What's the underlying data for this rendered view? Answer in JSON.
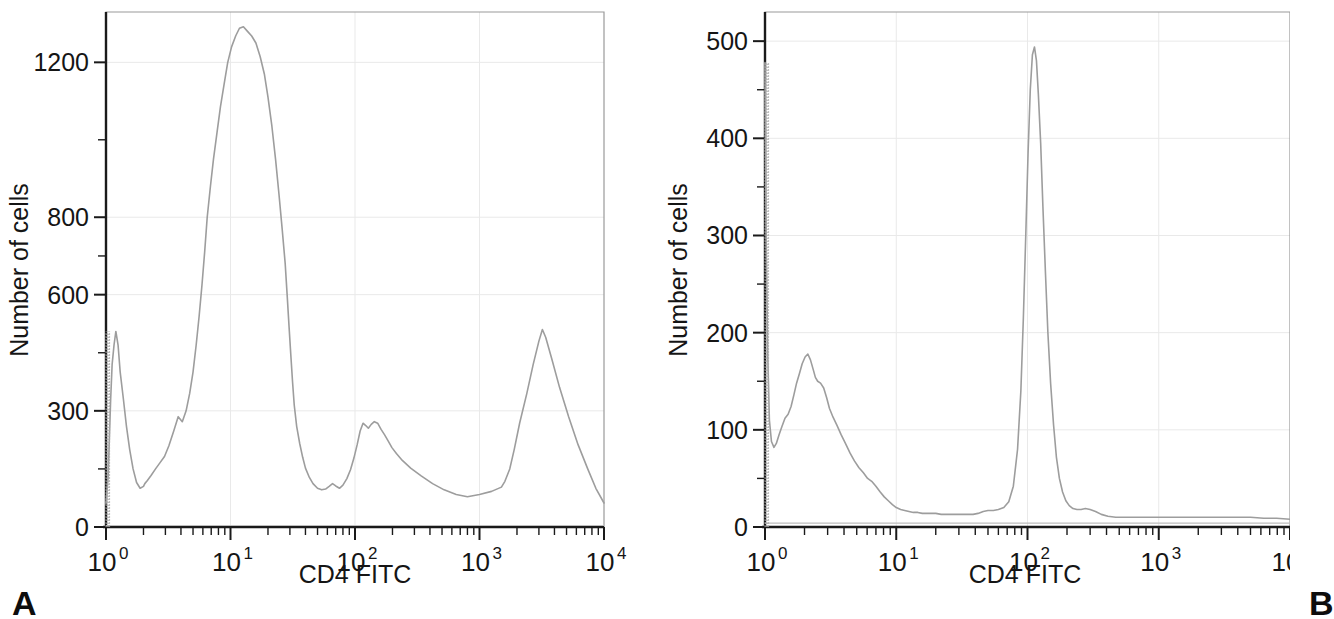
{
  "figure": {
    "background_color": "#ffffff",
    "trace_color": "#9d9d9d",
    "axis_color": "#1a1a1a",
    "grid_color": "#e9e9e9"
  },
  "panels": [
    {
      "letter": "A",
      "x_axis_title": "CD4 FITC",
      "y_axis_title": "Number of cells",
      "x_tick_bases": [
        "10",
        "10",
        "10",
        "10",
        "10"
      ],
      "x_tick_exponents": [
        "0",
        "1",
        "2",
        "3",
        "4"
      ],
      "y_tick_labels": [
        "1200",
        "800",
        "600",
        "300",
        "0"
      ]
    },
    {
      "letter": "B",
      "x_axis_title": "CD4 FITC",
      "y_axis_title": "Number of cells",
      "x_tick_bases": [
        "10",
        "10",
        "10",
        "10",
        "10"
      ],
      "x_tick_exponents": [
        "0",
        "1",
        "2",
        "3",
        "4"
      ],
      "y_tick_labels": [
        "500",
        "400",
        "300",
        "200",
        "100",
        "0"
      ]
    }
  ],
  "chart_data": [
    {
      "type": "line",
      "panel": "A",
      "title": "",
      "xlabel": "CD4 FITC",
      "ylabel": "Number of cells",
      "xscale": "log",
      "xlim": [
        1,
        10000
      ],
      "ylim": [
        0,
        1330
      ],
      "x_tick_values": [
        1,
        10,
        100,
        1000,
        10000
      ],
      "x_tick_labels": [
        "10^0",
        "10^1",
        "10^2",
        "10^3",
        "10^4"
      ],
      "y_tick_values": [
        0,
        300,
        600,
        800,
        1200
      ],
      "y_tick_labels": [
        "0",
        "300",
        "600",
        "800",
        "1200"
      ],
      "grid": true,
      "legend": "none",
      "series": [
        {
          "name": "CD4 FITC histogram (panel A)",
          "x": [
            1.0,
            1.02,
            1.04,
            1.06,
            1.09,
            1.12,
            1.16,
            1.2,
            1.25,
            1.3,
            1.38,
            1.46,
            1.55,
            1.65,
            1.76,
            1.88,
            2.0,
            2.05,
            2.15,
            2.3,
            2.5,
            2.7,
            2.95,
            3.2,
            3.5,
            3.8,
            4.1,
            4.4,
            4.7,
            5.0,
            5.3,
            5.6,
            5.9,
            6.2,
            6.5,
            6.9,
            7.3,
            7.8,
            8.3,
            8.9,
            9.5,
            10.2,
            11.0,
            11.8,
            12.7,
            13.7,
            14.8,
            16.0,
            17.3,
            18.7,
            20.0,
            21.5,
            23.0,
            24.5,
            26.0,
            27.5,
            28.5,
            29.5,
            30.5,
            31.5,
            32.5,
            34.0,
            36.0,
            38.0,
            40.0,
            43.0,
            46.0,
            50.0,
            54.0,
            58.0,
            62.0,
            66.0,
            70.0,
            75.0,
            80.0,
            86.0,
            92.0,
            98.0,
            104.0,
            110.0,
            116.0,
            122.0,
            128.0,
            135.0,
            143.0,
            152.0,
            162.0,
            173.0,
            185.0,
            198.0,
            215.0,
            240.0,
            280.0,
            340.0,
            420.0,
            520.0,
            650.0,
            800.0,
            1000.0,
            1250.0,
            1500.0,
            1600.0,
            1750.0,
            1900.0,
            2100.0,
            2400.0,
            2700.0,
            3000.0,
            3200.0,
            3400.0,
            3800.0,
            4400.0,
            5200.0,
            6200.0,
            7400.0,
            8600.0,
            10000.0
          ],
          "y": [
            60,
            95,
            130,
            210,
            330,
            420,
            470,
            505,
            470,
            400,
            330,
            260,
            200,
            150,
            115,
            100,
            105,
            112,
            120,
            133,
            150,
            165,
            182,
            210,
            248,
            285,
            272,
            300,
            345,
            400,
            470,
            545,
            625,
            710,
            800,
            880,
            950,
            1020,
            1085,
            1145,
            1200,
            1240,
            1268,
            1288,
            1292,
            1280,
            1268,
            1250,
            1215,
            1170,
            1110,
            1035,
            950,
            860,
            770,
            680,
            600,
            520,
            445,
            375,
            315,
            260,
            215,
            180,
            152,
            128,
            112,
            100,
            96,
            98,
            105,
            112,
            106,
            100,
            108,
            125,
            148,
            178,
            212,
            248,
            268,
            262,
            255,
            265,
            272,
            268,
            252,
            238,
            222,
            205,
            190,
            172,
            152,
            132,
            112,
            96,
            84,
            78,
            84,
            92,
            103,
            118,
            150,
            200,
            268,
            345,
            420,
            480,
            510,
            490,
            435,
            360,
            285,
            212,
            150,
            100,
            62
          ],
          "spike": {
            "x": 1.0,
            "y_top": 505,
            "description": "dense vertical spike at channel 1 from 0 to ~505"
          }
        }
      ],
      "features": {
        "peak_1_x": 1.0,
        "peak_1_y": 505,
        "peak_2_x": 5.6,
        "peak_2_y": 1290,
        "peak_3_x": 29.0,
        "peak_3_y": 272,
        "peak_4_x": 115.0,
        "peak_4_y": 500,
        "baseline_after_200": 12
      }
    },
    {
      "type": "line",
      "panel": "B",
      "title": "",
      "xlabel": "CD4 FITC",
      "ylabel": "Number of cells",
      "xscale": "log",
      "xlim": [
        1,
        10000
      ],
      "ylim": [
        0,
        530
      ],
      "x_tick_values": [
        1,
        10,
        100,
        1000,
        10000
      ],
      "x_tick_labels": [
        "10^0",
        "10^1",
        "10^2",
        "10^3",
        "10^4"
      ],
      "y_tick_values": [
        0,
        100,
        200,
        300,
        400,
        500
      ],
      "y_tick_labels": [
        "0",
        "100",
        "200",
        "300",
        "400",
        "500"
      ],
      "grid": true,
      "legend": "none",
      "series": [
        {
          "name": "CD4 FITC histogram (panel B)",
          "x": [
            1.0,
            1.02,
            1.05,
            1.08,
            1.12,
            1.17,
            1.22,
            1.28,
            1.35,
            1.42,
            1.5,
            1.58,
            1.66,
            1.74,
            1.83,
            1.92,
            2.02,
            2.12,
            2.22,
            2.32,
            2.42,
            2.52,
            2.65,
            2.8,
            2.95,
            3.1,
            3.3,
            3.55,
            3.8,
            4.1,
            4.45,
            4.8,
            5.2,
            5.6,
            6.05,
            6.5,
            7.0,
            7.55,
            8.1,
            8.7,
            9.35,
            10.0,
            10.8,
            11.6,
            12.5,
            13.5,
            14.6,
            15.8,
            17.1,
            18.5,
            20.0,
            22.0,
            24.0,
            26.5,
            29.0,
            32.0,
            35.0,
            38.5,
            42.0,
            46.0,
            50.0,
            55.0,
            60.0,
            66.0,
            72.0,
            78.0,
            84.0,
            89.0,
            93.0,
            97.0,
            101.0,
            105.0,
            109.0,
            113.0,
            117.0,
            121.0,
            126.0,
            131.0,
            137.0,
            143.0,
            150.0,
            158.0,
            166.0,
            175.0,
            185.0,
            196.0,
            208.0,
            222.0,
            238.0,
            256.0,
            276.0,
            300.0,
            330.0,
            365.0,
            410.0,
            470.0,
            550.0,
            650.0,
            780.0,
            950.0,
            1150.0,
            1400.0,
            1700.0,
            2100.0,
            2600.0,
            3200.0,
            4000.0,
            5000.0,
            6300.0,
            7900.0,
            10000.0
          ],
          "y": [
            478,
            300,
            175,
            110,
            88,
            82,
            86,
            95,
            104,
            112,
            116,
            124,
            136,
            148,
            158,
            168,
            175,
            178,
            172,
            163,
            154,
            150,
            148,
            143,
            133,
            122,
            113,
            104,
            95,
            86,
            76,
            68,
            61,
            56,
            50,
            47,
            42,
            36,
            31,
            27,
            23,
            20,
            18,
            17,
            16,
            15,
            15,
            14,
            14,
            14,
            14,
            13,
            13,
            13,
            13,
            13,
            13,
            13,
            14,
            16,
            17,
            17,
            18,
            20,
            26,
            42,
            80,
            140,
            215,
            300,
            385,
            450,
            486,
            494,
            480,
            445,
            395,
            330,
            262,
            200,
            148,
            105,
            72,
            50,
            36,
            27,
            22,
            19,
            18,
            18,
            19,
            18,
            16,
            13,
            11,
            10,
            10,
            10,
            10,
            10,
            10,
            10,
            10,
            10,
            10,
            10,
            10,
            10,
            9,
            9,
            8
          ],
          "spike": {
            "x": 1.0,
            "y_top": 478,
            "description": "narrow vertical spike at channel 1 reaching ~478"
          }
        }
      ],
      "features": {
        "peak_1_x": 1.0,
        "peak_1_y": 478,
        "peak_2_x": 2.15,
        "peak_2_y": 178,
        "peak_3_x": 115.0,
        "peak_3_y": 494,
        "baseline_tail": 10
      }
    }
  ]
}
